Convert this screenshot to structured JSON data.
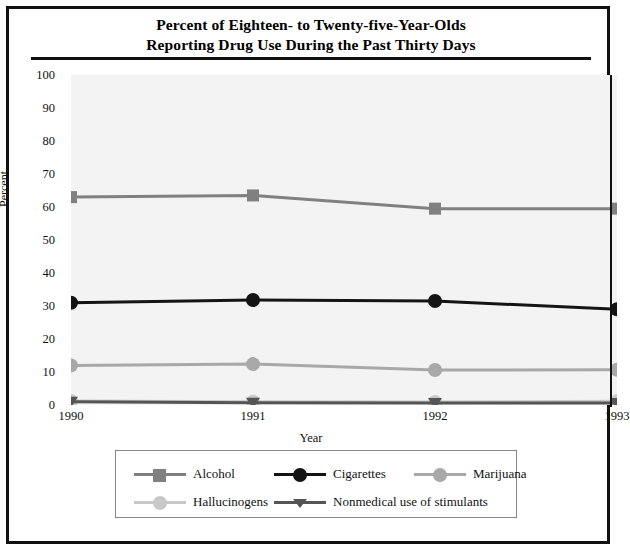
{
  "title": {
    "line1": "Percent of Eighteen- to Twenty-five-Year-Olds",
    "line2": "Reporting Drug Use During the Past Thirty Days"
  },
  "chart_data": {
    "type": "line",
    "title": "Percent of Eighteen- to Twenty-five-Year-Olds Reporting Drug Use During the Past Thirty Days",
    "xlabel": "Year",
    "ylabel": "Percent",
    "categories": [
      "1990",
      "1991",
      "1992",
      "1993"
    ],
    "x": [
      1990,
      1991,
      1992,
      1993
    ],
    "ylim": [
      0,
      100
    ],
    "ytick_labels": [
      "0",
      "10",
      "20",
      "30",
      "40",
      "50",
      "60",
      "70",
      "80",
      "90",
      "100"
    ],
    "yticks": [
      0,
      10,
      20,
      30,
      40,
      50,
      60,
      70,
      80,
      90,
      100
    ],
    "grid": false,
    "legend_position": "bottom",
    "series": [
      {
        "name": "Alcohol",
        "values": [
          63.0,
          63.5,
          59.5,
          59.5
        ],
        "color": "#808080",
        "marker": "square"
      },
      {
        "name": "Cigarettes",
        "values": [
          31.0,
          31.8,
          31.5,
          29.0
        ],
        "color": "#141414",
        "marker": "circle"
      },
      {
        "name": "Marijuana",
        "values": [
          12.0,
          12.4,
          10.6,
          10.7
        ],
        "color": "#a8a8a8",
        "marker": "circle"
      },
      {
        "name": "Hallucinogens",
        "values": [
          1.2,
          1.0,
          0.9,
          1.1
        ],
        "color": "#c8c8c8",
        "marker": "circle"
      },
      {
        "name": "Nonmedical use of stimulants",
        "values": [
          1.0,
          0.7,
          0.6,
          0.6
        ],
        "color": "#555555",
        "marker": "triangle-down"
      }
    ]
  },
  "legend": {
    "row1": [
      "Alcohol",
      "Cigarettes",
      "Marijuana"
    ],
    "row2": [
      "Hallucinogens",
      "Nonmedical use of stimulants"
    ]
  }
}
